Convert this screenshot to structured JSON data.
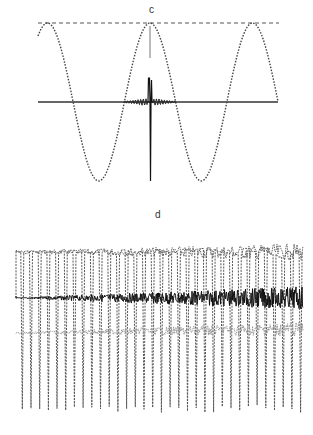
{
  "chart_data": [
    {
      "type": "line",
      "title": "c",
      "xlabel": "",
      "ylabel": "",
      "grid": false,
      "legend": null,
      "series": [
        {
          "name": "sinusoid (dotted)",
          "description": "cosine wave, ~2.33 periods, peaks at 3 positions touching dashed reference line",
          "amplitude": 1.0,
          "periods": 2.33
        },
        {
          "name": "reference level (dashed)",
          "y": 1.0
        },
        {
          "name": "zero axis",
          "y": 0.0
        },
        {
          "name": "central impulse response",
          "description": "sharp spike at center with small damped oscillations either side",
          "peak_up": 0.3,
          "peak_down": -0.95
        }
      ],
      "annotations": [
        "short vertical line below central peak"
      ]
    },
    {
      "type": "line",
      "title": "d",
      "xlabel": "",
      "ylabel": "",
      "grid": false,
      "legend": null,
      "series": [
        {
          "name": "oscillating trace (dotted)",
          "description": "periodic waveform, ~33 cycles, noise increasing toward right",
          "cycles": 33
        },
        {
          "name": "dark noisy band",
          "description": "black trace near middle, amplitude growing left to right"
        },
        {
          "name": "light gray band",
          "description": "gray noisy trace below dark band, amplitude growing left to right"
        }
      ]
    }
  ],
  "labels": {
    "c": "c",
    "d": "d"
  }
}
